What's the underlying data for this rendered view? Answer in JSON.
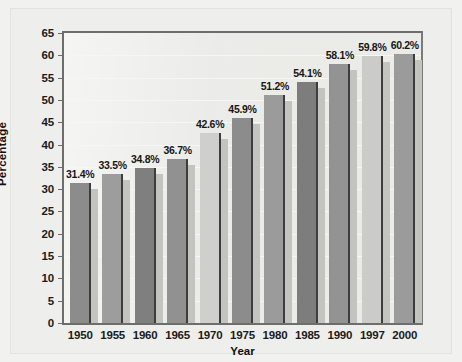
{
  "chart_data": {
    "type": "bar",
    "title": "",
    "xlabel": "Year",
    "ylabel": "Percentage",
    "categories": [
      "1950",
      "1955",
      "1960",
      "1965",
      "1970",
      "1975",
      "1980",
      "1985",
      "1990",
      "1997",
      "2000"
    ],
    "values": [
      31.4,
      33.5,
      34.8,
      36.7,
      42.6,
      45.9,
      51.2,
      54.1,
      58.1,
      59.8,
      60.2
    ],
    "data_labels": [
      "31.4%",
      "33.5%",
      "34.8%",
      "36.7%",
      "42.6%",
      "45.9%",
      "51.2%",
      "54.1%",
      "58.1%",
      "59.8%",
      "60.2%"
    ],
    "bar_colors": [
      "#8c8c8c",
      "#9d9d9d",
      "#7f7f7f",
      "#919191",
      "#cfcfcb",
      "#8c8c8c",
      "#9b9b9b",
      "#7d7d7d",
      "#939393",
      "#cbcbc7",
      "#9b9b9b"
    ],
    "ylim": [
      0,
      65
    ],
    "yticks": [
      0,
      5,
      10,
      15,
      20,
      25,
      30,
      35,
      40,
      45,
      50,
      55,
      60,
      65
    ],
    "ytick_labels": [
      "0",
      "5",
      "10",
      "15",
      "20",
      "25",
      "30",
      "35",
      "40",
      "45",
      "50",
      "55",
      "60",
      "65"
    ],
    "grid": true,
    "grid_axis": "y",
    "legend": false,
    "legend_position": "none",
    "plot_background": "#e9e9e6",
    "axis_color": "#6d6d6d",
    "label_color": "#161616"
  }
}
